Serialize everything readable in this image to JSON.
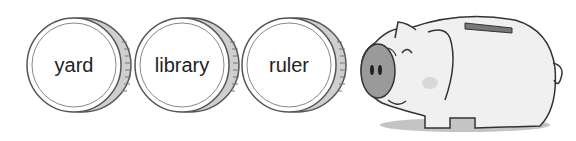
{
  "coins": [
    {
      "label": "yard"
    },
    {
      "label": "library"
    },
    {
      "label": "ruler"
    }
  ],
  "piggy_bank": {
    "icon": "piggy-bank-icon"
  },
  "colors": {
    "coin_outline": "#555555",
    "coin_rim": "#bdbdbd",
    "pig_snout": "#9a9a9a",
    "pig_body": "#efefef",
    "shadow": "#bbbbbb"
  }
}
